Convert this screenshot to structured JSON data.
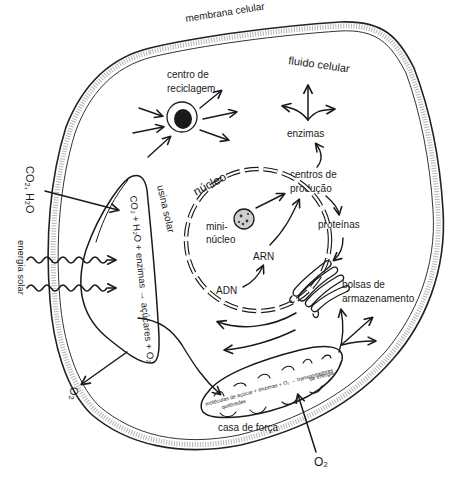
{
  "diagram": {
    "colors": {
      "ink": "#1a1a1a",
      "background": "#ffffff",
      "membrane_texture": "#777777"
    },
    "labels": {
      "membrane": "membrana celular",
      "fluid": "fluido celular",
      "recycling_center_1": "centro de",
      "recycling_center_2": "reciclagem",
      "enzymes": "enzimas",
      "production_centers_1": "centros de",
      "production_centers_2": "produção",
      "nucleus": "núcleo",
      "mini_nucleus_1": "mini-",
      "mini_nucleus_2": "núcleo",
      "rna": "ARN",
      "dna": "ADN",
      "proteins": "proteínas",
      "storage_1": "bolsas de",
      "storage_2": "armazenamento",
      "solar_plant": "usina solar",
      "solar_equation": "CO₂ + H₂O + enzimas → açúcares + O₂",
      "co2_h2o": "CO₂, H₂O",
      "solar_energy": "energia solar",
      "o2_left": "O₂",
      "power_house": "casa de força",
      "power_equation_1": "moléculas de açúcar + enzimas + O₂ → transportadores",
      "power_equation_2": "quebradas",
      "power_equation_3": "de energia",
      "o2_bottom": "O₂"
    }
  }
}
